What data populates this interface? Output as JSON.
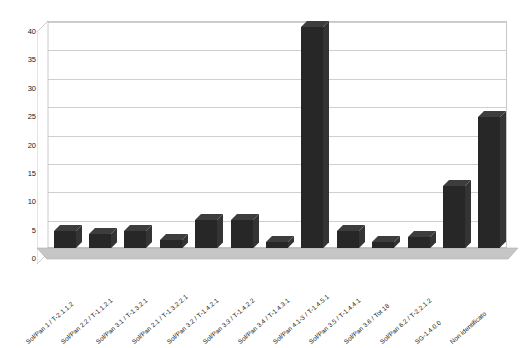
{
  "chart_data": {
    "type": "bar",
    "title": "",
    "subtitle": "",
    "xlabel": "",
    "ylabel": "",
    "ylim": [
      0,
      40
    ],
    "ytick_step": 5,
    "yticks": [
      "0",
      "5",
      "10",
      "15",
      "20",
      "25",
      "30",
      "35",
      "40"
    ],
    "grid": true,
    "legend": false,
    "bar_color": "#272727",
    "floor_color": "#c6c6c6",
    "grid_color": "#cfcfcf",
    "categories": [
      "Sol/Pan 1 / T-2.1.1.2",
      "Sol/Pan 2.2 / T-1.1.2.1",
      "Sol/Pan 3.1 / T-1.3.2.1",
      "Sol/Pan 2.1 / T-1.3.2.2.1",
      "Sol/Pan 3.2 / T-1.4.2.1",
      "Sol/Pan 3.3 / T-1.4.2.2",
      "Sol/Pan 3.4 / T-1.4.3.1",
      "Sol/Pan 4.1-3 / T-1.4.5.1",
      "Sol/Pan 3.5 / T-1.4.4.1",
      "Sol/Pan 3.6 / Tot 18",
      "Sol/Pan 6.2 / T-2.2.1.2",
      "SG-1.4.0.0",
      "Non identificato"
    ],
    "values": [
      3,
      2.5,
      3,
      1.5,
      5,
      5,
      1,
      39,
      3,
      1,
      2,
      11,
      23
    ]
  }
}
